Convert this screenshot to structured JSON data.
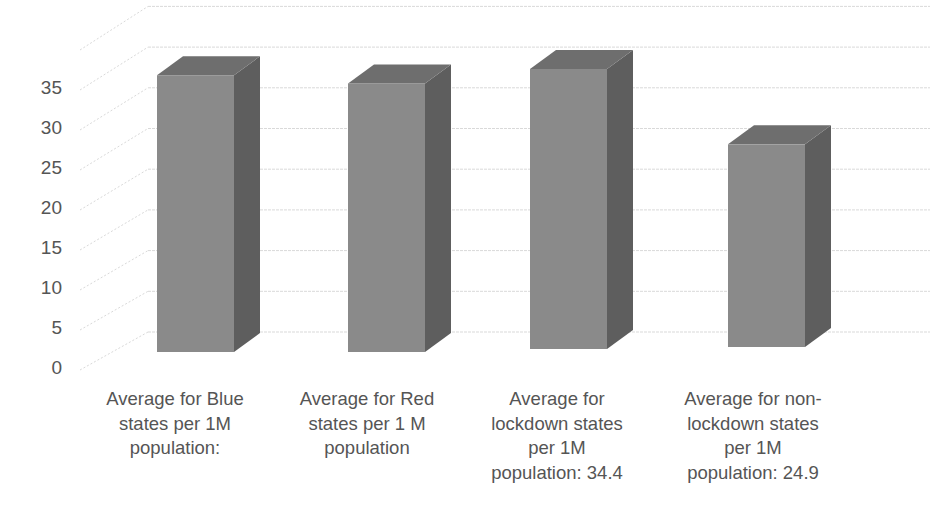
{
  "chart_data": {
    "type": "bar",
    "style": "3d-column",
    "title": "",
    "xlabel": "",
    "ylabel": "",
    "ylim": [
      0,
      40
    ],
    "y_ticks": [
      0,
      5,
      10,
      15,
      20,
      25,
      30,
      35
    ],
    "grid": true,
    "legend": null,
    "categories": [
      "Average for Blue states per 1M population:",
      "Average for Red states per 1 M population",
      "Average for lockdown states per 1M population: 34.4",
      "Average for non-lockdown states per 1M population: 24.9"
    ],
    "category_label_lines": [
      "Average for Blue\nstates per 1M\npopulation:",
      "Average for Red\nstates per 1 M\npopulation",
      "Average for\nlockdown states\nper 1M\npopulation: 34.4",
      "Average for non-\nlockdown states\nper 1M\npopulation: 24.9"
    ],
    "values": [
      34.0,
      33.0,
      34.4,
      24.9
    ],
    "colors": {
      "bar_front": "#8a8a8a",
      "bar_side": "#5e5e5e",
      "bar_top": "#6e6e6e",
      "grid": "#d9d9d9",
      "text": "#555555"
    }
  }
}
